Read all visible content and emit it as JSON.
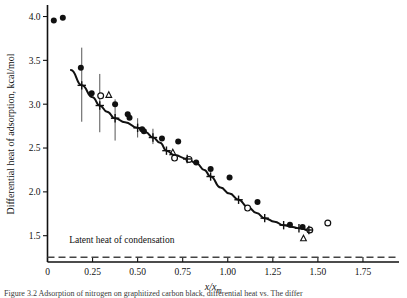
{
  "figure": {
    "caption_prefix": "Figure 3.2",
    "caption_text": "Figure 3.2  Adsorption of nitrogen on graphitized carbon black, differential heat vs. The differ"
  },
  "chart_data": {
    "type": "scatter",
    "title": "",
    "xlabel": "x/xm",
    "xlabel_main": "x/x",
    "xlabel_sub": "m",
    "ylabel": "Differential heat of adsorption, kcal/mol",
    "xlim": [
      0.0,
      1.95
    ],
    "ylim": [
      1.2,
      4.12
    ],
    "xticks": [
      0,
      0.25,
      0.5,
      0.75,
      1.0,
      1.25,
      1.5,
      1.75
    ],
    "xticklabels": [
      "0",
      "0.25",
      "0.50",
      "0.75",
      "1.00",
      "1.25",
      "1.50",
      "1.75"
    ],
    "yticks": [
      1.5,
      2.0,
      2.5,
      3.0,
      3.5,
      4.0
    ],
    "yticklabels": [
      "1.5",
      "2.0",
      "2.5",
      "3.0",
      "3.5",
      "4.0"
    ],
    "grid": false,
    "legend_position": "none",
    "annotations": [
      {
        "name": "latent-heat-of-condensation",
        "text": "Latent heat of condensation",
        "x": 0.12,
        "y": 1.42
      }
    ],
    "reference_lines": [
      {
        "name": "latent-heat-line",
        "orientation": "horizontal",
        "y": 1.255,
        "style": "dashed",
        "color": "#444444"
      }
    ],
    "series": [
      {
        "name": "filled-circles",
        "marker": "filled-circle",
        "color": "#111111",
        "points": [
          [
            0.035,
            3.955
          ],
          [
            0.085,
            3.985
          ],
          [
            0.185,
            3.415
          ],
          [
            0.245,
            3.125
          ],
          [
            0.375,
            3.0
          ],
          [
            0.445,
            2.885
          ],
          [
            0.455,
            2.845
          ],
          [
            0.525,
            2.715
          ],
          [
            0.535,
            2.69
          ],
          [
            0.635,
            2.61
          ],
          [
            0.725,
            2.575
          ],
          [
            0.825,
            2.335
          ],
          [
            0.905,
            2.26
          ],
          [
            1.01,
            2.165
          ],
          [
            1.165,
            1.885
          ],
          [
            1.345,
            1.625
          ],
          [
            1.415,
            1.6
          ]
        ]
      },
      {
        "name": "open-circles",
        "marker": "open-circle",
        "color": "#111111",
        "points": [
          [
            0.295,
            3.095
          ],
          [
            0.705,
            2.385
          ],
          [
            0.785,
            2.37
          ],
          [
            1.11,
            1.815
          ],
          [
            1.455,
            1.565
          ],
          [
            1.555,
            1.645
          ]
        ]
      },
      {
        "name": "open-triangles",
        "marker": "open-triangle",
        "color": "#111111",
        "points": [
          [
            0.34,
            3.105
          ],
          [
            0.695,
            2.45
          ],
          [
            1.42,
            1.47
          ]
        ]
      },
      {
        "name": "plus-markers",
        "marker": "plus",
        "color": "#111111",
        "points": [
          [
            0.19,
            3.215
          ],
          [
            0.29,
            2.985
          ],
          [
            0.375,
            2.84
          ],
          [
            0.5,
            2.73
          ],
          [
            0.585,
            2.62
          ],
          [
            0.66,
            2.47
          ],
          [
            0.775,
            2.375
          ],
          [
            0.905,
            2.175
          ],
          [
            1.06,
            1.91
          ],
          [
            1.205,
            1.7
          ],
          [
            1.31,
            1.62
          ],
          [
            1.395,
            1.585
          ],
          [
            1.45,
            1.565
          ]
        ]
      }
    ],
    "error_bars": [
      {
        "x": 0.19,
        "y": 3.215,
        "lower": 2.8,
        "upper": 3.645
      },
      {
        "x": 0.29,
        "y": 2.985,
        "lower": 2.68,
        "upper": 3.345
      },
      {
        "x": 0.375,
        "y": 2.84,
        "lower": 2.585,
        "upper": 3.055
      },
      {
        "x": 0.5,
        "y": 2.73,
        "lower": 2.62,
        "upper": 2.84
      },
      {
        "x": 0.585,
        "y": 2.62,
        "lower": 2.545,
        "upper": 2.72
      }
    ],
    "fit_curve": {
      "name": "smoothed-fit-curve",
      "points": [
        [
          0.13,
          3.39
        ],
        [
          0.19,
          3.215
        ],
        [
          0.25,
          3.08
        ],
        [
          0.29,
          2.985
        ],
        [
          0.33,
          2.915
        ],
        [
          0.375,
          2.84
        ],
        [
          0.43,
          2.795
        ],
        [
          0.5,
          2.73
        ],
        [
          0.545,
          2.68
        ],
        [
          0.585,
          2.62
        ],
        [
          0.625,
          2.56
        ],
        [
          0.66,
          2.47
        ],
        [
          0.705,
          2.42
        ],
        [
          0.775,
          2.375
        ],
        [
          0.83,
          2.32
        ],
        [
          0.87,
          2.25
        ],
        [
          0.905,
          2.175
        ],
        [
          0.96,
          2.05
        ],
        [
          1.01,
          1.98
        ],
        [
          1.06,
          1.91
        ],
        [
          1.11,
          1.83
        ],
        [
          1.16,
          1.76
        ],
        [
          1.205,
          1.7
        ],
        [
          1.26,
          1.66
        ],
        [
          1.31,
          1.62
        ],
        [
          1.36,
          1.6
        ],
        [
          1.395,
          1.585
        ],
        [
          1.45,
          1.565
        ]
      ]
    }
  }
}
